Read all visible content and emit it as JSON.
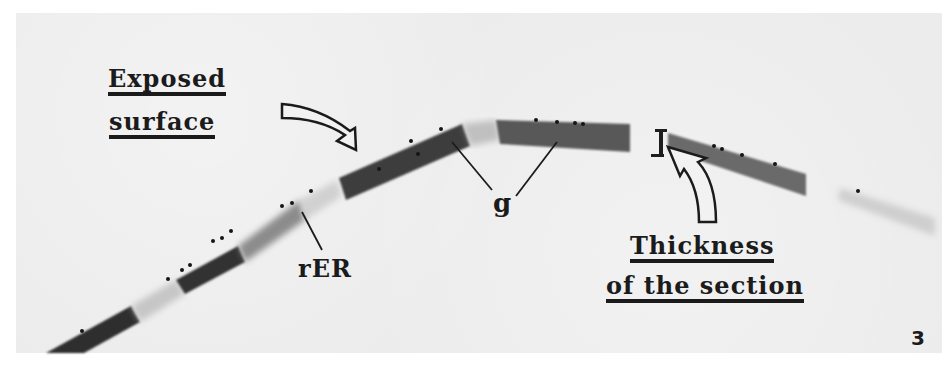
{
  "figure": {
    "panel_number": "3",
    "labels": {
      "exposed_surface_line1": "Exposed",
      "exposed_surface_line2": "surface",
      "thickness_line1": "Thickness",
      "thickness_line2": "of the section",
      "golgi": "g",
      "rough_er": "rER"
    },
    "colors": {
      "background": "#ececec",
      "dense_band": "#3a3a3a",
      "medium_band": "#5e5e5e",
      "text": "#1b1b1b"
    }
  }
}
